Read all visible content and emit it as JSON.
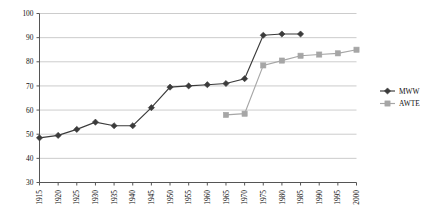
{
  "chart_data": {
    "type": "line",
    "title": "",
    "subtitle": "",
    "xlabel": "",
    "ylabel": "",
    "xlim": [
      1915,
      2000
    ],
    "ylim": [
      30,
      100
    ],
    "ytick_step": 10,
    "xtick_step": 5,
    "grid": true,
    "grid_axis": "y",
    "legend_position": "right",
    "categories": [
      "1915",
      "1920",
      "1925",
      "1930",
      "1935",
      "1940",
      "1945",
      "1950",
      "1955",
      "1960",
      "1965",
      "1970",
      "1975",
      "1980",
      "1985",
      "1990",
      "1995",
      "2000"
    ],
    "xticklabels": [
      "1915",
      "1920",
      "1925",
      "1930",
      "1935",
      "1940",
      "1945",
      "1950",
      "1955",
      "1960",
      "1965",
      "1970",
      "1975",
      "1980",
      "1985",
      "1990",
      "1995",
      "2000"
    ],
    "yticklabels": [
      "30",
      "40",
      "50",
      "60",
      "70",
      "80",
      "90",
      "100"
    ],
    "yticks": [
      30,
      40,
      50,
      60,
      70,
      80,
      90,
      100
    ],
    "series": [
      {
        "name": "MWW",
        "color": "#3b3b3b",
        "marker": "diamond",
        "x": [
          1915,
          1920,
          1925,
          1930,
          1935,
          1940,
          1945,
          1950,
          1955,
          1960,
          1965,
          1970,
          1975,
          1980,
          1985
        ],
        "values": [
          48.5,
          49.5,
          52,
          55,
          53.5,
          53.5,
          61,
          69.5,
          70,
          70.5,
          71,
          73,
          91,
          91.5,
          91.5
        ]
      },
      {
        "name": "AWTE",
        "color": "#a6a6a6",
        "marker": "square",
        "x": [
          1965,
          1970,
          1975,
          1980,
          1985,
          1990,
          1995,
          2000
        ],
        "values": [
          58,
          58.5,
          78.5,
          80.5,
          82.5,
          83,
          83.5,
          85
        ]
      }
    ],
    "legend": [
      {
        "label": "MWW",
        "color": "#3b3b3b",
        "marker": "diamond"
      },
      {
        "label": "AWTE",
        "color": "#a6a6a6",
        "marker": "square"
      }
    ]
  },
  "colors": {
    "mww": "#3b3b3b",
    "awte": "#a6a6a6",
    "grid": "#bfbfbf",
    "axis": "#555555",
    "background": "#ffffff"
  }
}
